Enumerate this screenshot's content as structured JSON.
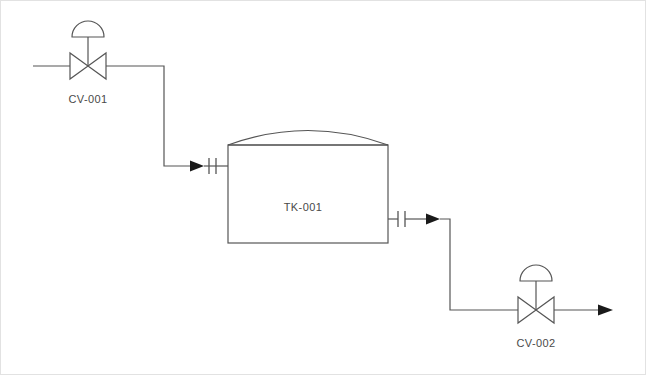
{
  "diagram": {
    "type": "P&ID",
    "background_color": "#ffffff",
    "line_color": "#555555",
    "text_color": "#4a4a4a",
    "equipment": {
      "inlet_valve": {
        "tag": "CV-001",
        "kind": "control-valve",
        "actuator": "diaphragm",
        "center_x": 88,
        "center_y": 66,
        "label_x": 88,
        "label_y": 103
      },
      "tank": {
        "tag": "TK-001",
        "kind": "storage-tank",
        "head": "domed",
        "bottom": "flat",
        "left": 228,
        "right": 388,
        "top": 145,
        "bottom_y": 243,
        "dome_peak_y": 122,
        "label_x": 303,
        "label_y": 211
      },
      "outlet_valve": {
        "tag": "CV-002",
        "kind": "control-valve",
        "actuator": "diaphragm",
        "center_x": 536,
        "center_y": 310,
        "label_x": 536,
        "label_y": 347
      }
    },
    "streams": {
      "inlet": {
        "name": "inlet-stream",
        "from_x": 33,
        "y": 66,
        "riser_x": 164,
        "drop_y": 166,
        "to_x": 228
      },
      "outlet": {
        "name": "outlet-stream",
        "from_x": 388,
        "y": 219,
        "riser_x": 450,
        "drop_y": 310,
        "to_x": 612
      }
    },
    "nozzles": {
      "inlet_flange": {
        "name": "inlet-flange",
        "x": 212,
        "y": 166
      },
      "outlet_flange": {
        "name": "outlet-flange",
        "x": 401,
        "y": 219
      }
    }
  }
}
